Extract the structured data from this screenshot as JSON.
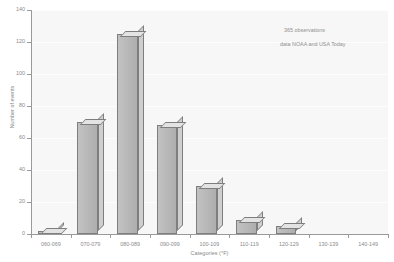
{
  "chart_data": {
    "type": "bar",
    "title": "",
    "subtitle": "",
    "xlabel": "Categories (°F)",
    "ylabel": "Number of events",
    "categories": [
      "060-069",
      "070-079",
      "080-089",
      "090-099",
      "100-109",
      "110-119",
      "120-129",
      "130-139",
      "140-149"
    ],
    "values": [
      2,
      70,
      125,
      68,
      30,
      9,
      5,
      0,
      0
    ],
    "series": [
      {
        "name": "Number of events",
        "values": [
          2,
          70,
          125,
          68,
          30,
          9,
          5,
          0,
          0
        ]
      }
    ],
    "ylim": [
      0,
      140
    ],
    "ytick_values": [
      0,
      20,
      40,
      60,
      80,
      100,
      120,
      140
    ],
    "ytick_labels": [
      "0",
      "20",
      "40",
      "60",
      "80",
      "100",
      "120",
      "140"
    ],
    "grid": true,
    "grid_axis": "y",
    "legend": false,
    "legend_position": "none",
    "style": "3d-bar",
    "annotations": [
      {
        "text": "365 observations",
        "x": 284,
        "y": 27
      },
      {
        "text": "data NOAA and USA Today",
        "x": 280,
        "y": 41
      }
    ]
  },
  "colors": {
    "plot_background": "#f7f7f7",
    "page_background": "#ffffff",
    "gridline": "#fdfdfd",
    "axis_line": "#9a9a9a",
    "tick_label": "#8a8a8a",
    "bar_front": "#b9b9b9",
    "bar_top": "#e3e3e3",
    "bar_side": "#cfcfcf",
    "bar_outline": "#7e7e7e",
    "annotation_text": "#8f8f8f"
  }
}
